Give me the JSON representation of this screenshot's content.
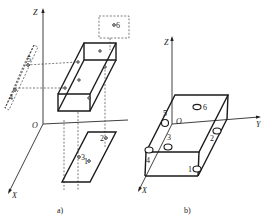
{
  "figure_a": {
    "caption": "a)",
    "axes": {
      "z": "Z",
      "y": "Y",
      "x": "X",
      "origin": "O"
    },
    "points": [
      {
        "id": "1",
        "label": "1"
      },
      {
        "id": "2",
        "label": "2"
      },
      {
        "id": "3",
        "label": "3"
      },
      {
        "id": "4",
        "label": "4"
      },
      {
        "id": "5",
        "label": "5"
      },
      {
        "id": "6",
        "label": "6"
      }
    ]
  },
  "figure_b": {
    "caption": "b)",
    "axes": {
      "z": "Z",
      "y": "Y",
      "x": "X",
      "origin": "O"
    },
    "pins": [
      {
        "id": "1",
        "label": "1"
      },
      {
        "id": "2",
        "label": "2"
      },
      {
        "id": "3",
        "label": "3"
      },
      {
        "id": "4",
        "label": "4"
      },
      {
        "id": "5",
        "label": "5"
      },
      {
        "id": "6",
        "label": "6"
      }
    ]
  },
  "colors": {
    "line": "#1a1a1a",
    "background": "#ffffff"
  }
}
